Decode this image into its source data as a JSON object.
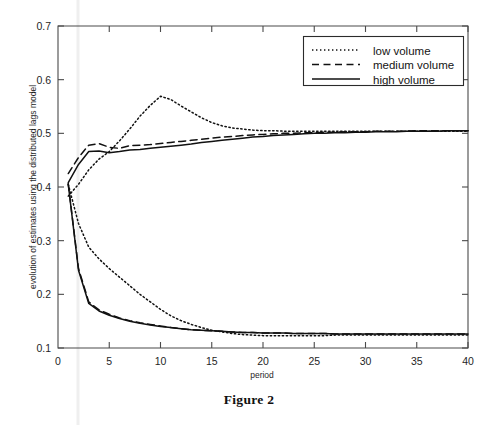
{
  "figure": {
    "caption": "Figure 2"
  },
  "chart_data": {
    "type": "line",
    "title": "",
    "xlabel": "period",
    "ylabel": "evolution of estimates using the distributed lags model",
    "xlim": [
      0,
      40
    ],
    "ylim": [
      0.1,
      0.7
    ],
    "xticks": [
      5,
      10,
      15,
      20,
      25,
      30,
      35,
      40
    ],
    "xtick_labels": [
      "5",
      "10",
      "15",
      "20",
      "25",
      "30",
      "35",
      "40"
    ],
    "yticks": [
      0.1,
      0.2,
      0.3,
      0.4,
      0.5,
      0.6,
      0.7
    ],
    "ytick_labels": [
      "0.1",
      "0.2",
      "0.3",
      "0.4",
      "0.5",
      "0.6",
      "0.7"
    ],
    "grid": false,
    "legend_position": "top-right",
    "x": [
      1,
      2,
      3,
      4,
      5,
      6,
      7,
      8,
      9,
      10,
      11,
      12,
      13,
      14,
      15,
      16,
      17,
      18,
      19,
      20,
      21,
      22,
      23,
      24,
      25,
      26,
      27,
      28,
      29,
      30,
      31,
      32,
      33,
      34,
      35,
      36,
      37,
      38,
      39,
      40
    ],
    "series": [
      {
        "name": "low volume",
        "style": "dotted",
        "color": "#111111",
        "group": "upper",
        "values": [
          0.383,
          0.405,
          0.432,
          0.452,
          0.466,
          0.486,
          0.508,
          0.532,
          0.552,
          0.569,
          0.563,
          0.551,
          0.54,
          0.529,
          0.52,
          0.514,
          0.51,
          0.508,
          0.506,
          0.505,
          0.505,
          0.504,
          0.504,
          0.504,
          0.504,
          0.504,
          0.504,
          0.504,
          0.504,
          0.504,
          0.504,
          0.504,
          0.504,
          0.504,
          0.504,
          0.504,
          0.504,
          0.504,
          0.504,
          0.504
        ]
      },
      {
        "name": "medium volume",
        "style": "dashed",
        "color": "#111111",
        "group": "upper",
        "values": [
          0.425,
          0.455,
          0.478,
          0.481,
          0.474,
          0.472,
          0.477,
          0.478,
          0.479,
          0.481,
          0.483,
          0.485,
          0.487,
          0.489,
          0.491,
          0.493,
          0.494,
          0.496,
          0.497,
          0.498,
          0.499,
          0.5,
          0.5,
          0.501,
          0.501,
          0.502,
          0.502,
          0.503,
          0.503,
          0.503,
          0.504,
          0.504,
          0.504,
          0.504,
          0.505,
          0.505,
          0.505,
          0.505,
          0.505,
          0.505
        ]
      },
      {
        "name": "high volume",
        "style": "solid",
        "color": "#111111",
        "group": "upper",
        "values": [
          0.408,
          0.442,
          0.466,
          0.467,
          0.464,
          0.466,
          0.469,
          0.47,
          0.472,
          0.474,
          0.476,
          0.478,
          0.48,
          0.483,
          0.485,
          0.487,
          0.489,
          0.491,
          0.493,
          0.494,
          0.496,
          0.497,
          0.498,
          0.499,
          0.5,
          0.5,
          0.501,
          0.501,
          0.502,
          0.502,
          0.503,
          0.503,
          0.503,
          0.504,
          0.504,
          0.504,
          0.504,
          0.505,
          0.505,
          0.505
        ]
      },
      {
        "name": "low volume",
        "style": "dotted",
        "color": "#111111",
        "group": "lower",
        "values": [
          0.405,
          0.332,
          0.288,
          0.266,
          0.248,
          0.232,
          0.216,
          0.2,
          0.186,
          0.172,
          0.16,
          0.151,
          0.144,
          0.138,
          0.133,
          0.13,
          0.127,
          0.125,
          0.124,
          0.123,
          0.123,
          0.123,
          0.123,
          0.123,
          0.123,
          0.123,
          0.124,
          0.124,
          0.124,
          0.124,
          0.124,
          0.124,
          0.124,
          0.124,
          0.124,
          0.124,
          0.124,
          0.124,
          0.124,
          0.124
        ]
      },
      {
        "name": "medium volume",
        "style": "dashed",
        "color": "#111111",
        "group": "lower",
        "values": [
          0.406,
          0.248,
          0.186,
          0.171,
          0.163,
          0.156,
          0.151,
          0.147,
          0.144,
          0.141,
          0.138,
          0.136,
          0.134,
          0.133,
          0.132,
          0.131,
          0.13,
          0.129,
          0.129,
          0.128,
          0.128,
          0.128,
          0.127,
          0.127,
          0.127,
          0.127,
          0.126,
          0.126,
          0.126,
          0.126,
          0.126,
          0.126,
          0.126,
          0.126,
          0.126,
          0.126,
          0.126,
          0.126,
          0.126,
          0.126
        ]
      },
      {
        "name": "high volume",
        "style": "solid",
        "color": "#111111",
        "group": "lower",
        "values": [
          0.405,
          0.245,
          0.183,
          0.169,
          0.161,
          0.155,
          0.15,
          0.146,
          0.143,
          0.14,
          0.138,
          0.136,
          0.134,
          0.133,
          0.132,
          0.131,
          0.13,
          0.129,
          0.129,
          0.128,
          0.128,
          0.128,
          0.127,
          0.127,
          0.127,
          0.127,
          0.126,
          0.126,
          0.126,
          0.126,
          0.126,
          0.126,
          0.126,
          0.126,
          0.126,
          0.126,
          0.126,
          0.126,
          0.126,
          0.126
        ]
      }
    ],
    "legend": [
      {
        "label": "low volume",
        "style": "dotted"
      },
      {
        "label": "medium volume",
        "style": "dashed"
      },
      {
        "label": "high volume",
        "style": "solid"
      }
    ]
  }
}
